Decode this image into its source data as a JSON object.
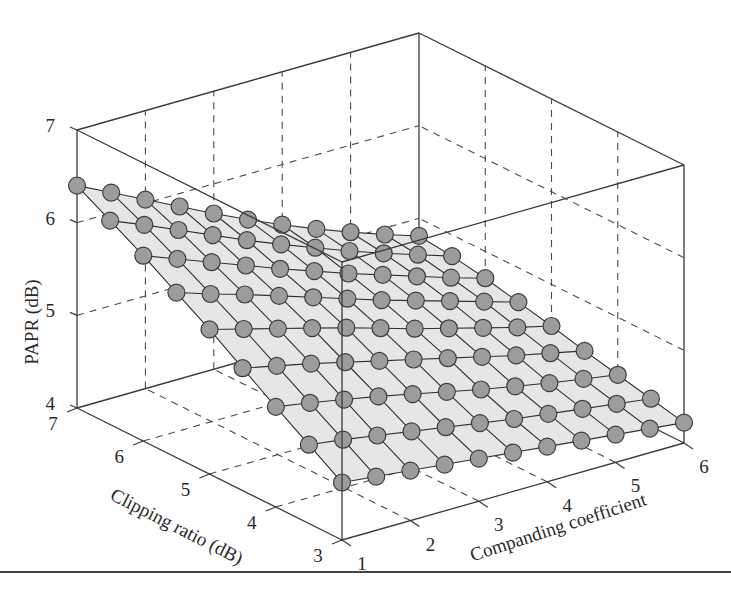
{
  "chart_data": {
    "type": "surface3d",
    "title": "",
    "xlabel": "Companding coefficient",
    "ylabel": "Clipping ratio (dB)",
    "zlabel": "PAPR (dB)",
    "xlim": [
      1,
      6
    ],
    "ylim": [
      3,
      7
    ],
    "zlim": [
      4,
      7
    ],
    "x_ticks": [
      "1",
      "2",
      "3",
      "4",
      "5",
      "6"
    ],
    "y_ticks": [
      "3",
      "4",
      "5",
      "6",
      "7"
    ],
    "z_ticks": [
      "4",
      "5",
      "6",
      "7"
    ],
    "grid": true,
    "marker": "circle",
    "marker_color": "#9c9c9c",
    "marker_edge_color": "#3c3c3c",
    "surface_color": "#e6e6e6",
    "x": [
      1.0,
      1.5,
      2.0,
      2.5,
      3.0,
      3.5,
      4.0,
      4.5,
      5.0,
      5.5,
      6.0
    ],
    "y": [
      3.0,
      3.5,
      4.0,
      4.5,
      5.0,
      5.5,
      6.0,
      6.5,
      7.0
    ],
    "z_note": "Estimated PAPR (dB) read from projected 3D surface; rows indexed by clipping ratio (y), columns by companding coefficient (x)",
    "z": [
      [
        4.62,
        4.58,
        4.54,
        4.5,
        4.46,
        4.42,
        4.38,
        4.34,
        4.3,
        4.26,
        4.22
      ],
      [
        4.85,
        4.8,
        4.74,
        4.68,
        4.62,
        4.56,
        4.5,
        4.45,
        4.4,
        4.35,
        4.3
      ],
      [
        5.08,
        5.02,
        4.95,
        4.88,
        4.8,
        4.72,
        4.64,
        4.57,
        4.5,
        4.44,
        4.38
      ],
      [
        5.32,
        5.24,
        5.16,
        5.07,
        4.98,
        4.89,
        4.8,
        4.71,
        4.62,
        4.54,
        4.46
      ],
      [
        5.56,
        5.46,
        5.36,
        5.26,
        5.16,
        5.05,
        4.94,
        4.84,
        4.74,
        4.64,
        4.55
      ],
      [
        5.78,
        5.66,
        5.55,
        5.43,
        5.31,
        5.19,
        5.07,
        4.96,
        4.85,
        4.74,
        4.63
      ],
      [
        6.0,
        5.86,
        5.72,
        5.58,
        5.44,
        5.31,
        5.18,
        5.06,
        4.94,
        4.82,
        4.71
      ],
      [
        6.2,
        6.05,
        5.89,
        5.73,
        5.57,
        5.42,
        5.28,
        5.14,
        5.01,
        4.89,
        4.77
      ],
      [
        6.4,
        6.22,
        6.04,
        5.86,
        5.68,
        5.51,
        5.35,
        5.2,
        5.06,
        4.93,
        4.81
      ]
    ]
  },
  "labels": {
    "z_axis": "PAPR (dB)",
    "y_axis": "Clipping ratio (dB)",
    "x_axis": "Companding coefficient"
  }
}
